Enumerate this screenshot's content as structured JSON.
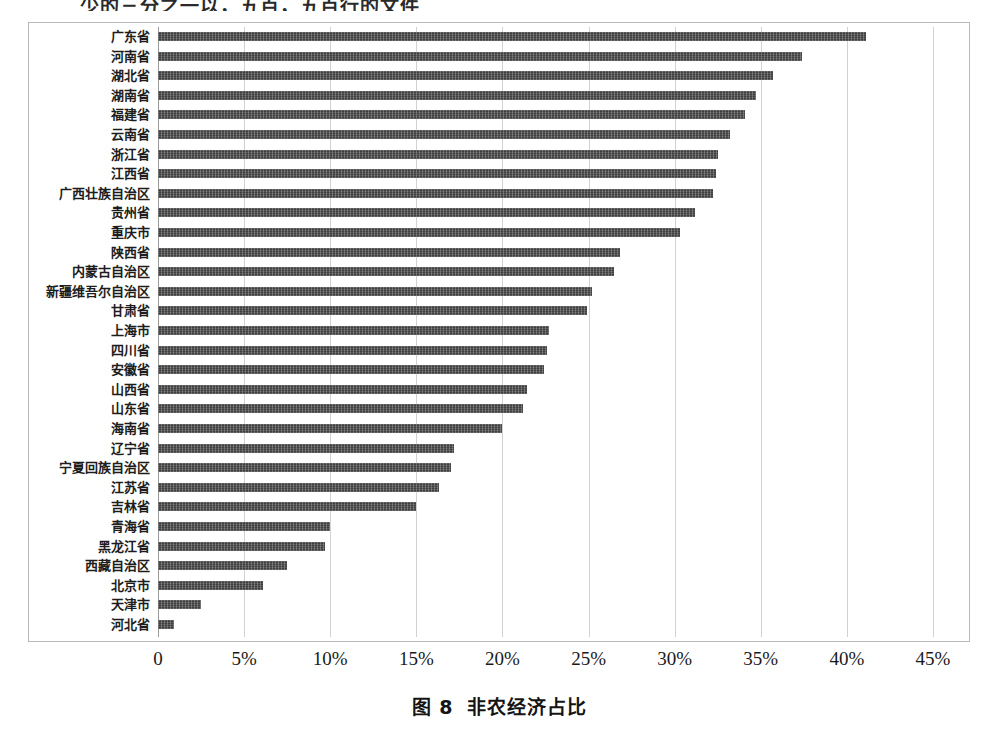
{
  "page": {
    "partial_heading_top": "少的三分之一以，五百，五百行的文件"
  },
  "caption": {
    "number": "图 8",
    "title": "非农经济占比"
  },
  "chart_data": {
    "type": "bar",
    "orientation": "horizontal",
    "title": "非农经济占比",
    "xlabel": "",
    "ylabel": "",
    "xlim": [
      0,
      45
    ],
    "grid": true,
    "legend": "none",
    "value_unit": "%",
    "tick_labels": [
      "0",
      "5%",
      "10%",
      "15%",
      "20%",
      "25%",
      "30%",
      "35%",
      "40%",
      "45%"
    ],
    "tick_values": [
      0,
      5,
      10,
      15,
      20,
      25,
      30,
      35,
      40,
      45
    ],
    "bar_color": "#3f3f3f",
    "categories": [
      "广东省",
      "河南省",
      "湖北省",
      "湖南省",
      "福建省",
      "云南省",
      "浙江省",
      "江西省",
      "广西壮族自治区",
      "贵州省",
      "重庆市",
      "陕西省",
      "内蒙古自治区",
      "新疆维吾尔自治区",
      "甘肃省",
      "上海市",
      "四川省",
      "安徽省",
      "山西省",
      "山东省",
      "海南省",
      "辽宁省",
      "宁夏回族自治区",
      "江苏省",
      "吉林省",
      "青海省",
      "黑龙江省",
      "西藏自治区",
      "北京市",
      "天津市",
      "河北省"
    ],
    "values": [
      41.1,
      37.4,
      35.7,
      34.7,
      34.1,
      33.2,
      32.5,
      32.4,
      32.2,
      31.2,
      30.3,
      26.8,
      26.5,
      25.2,
      24.9,
      22.7,
      22.6,
      22.4,
      21.4,
      21.2,
      20.0,
      17.2,
      17.0,
      16.3,
      15.0,
      10.0,
      9.7,
      7.5,
      6.1,
      2.5,
      0.9
    ]
  }
}
